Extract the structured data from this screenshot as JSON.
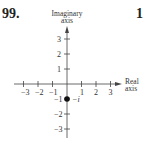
{
  "problem_number": "99.",
  "next_problem_number": "1",
  "diagram": {
    "y_axis_label_line1": "Imaginary",
    "y_axis_label_line2": "axis",
    "x_axis_label_line1": "Real",
    "x_axis_label_line2": "axis",
    "x_ticks": [
      "−3",
      "−2",
      "−1",
      "1",
      "2",
      "3"
    ],
    "y_ticks": [
      "3",
      "2",
      "1",
      "−1",
      "−2",
      "−3"
    ],
    "point_label": "−i",
    "point": {
      "x": 0,
      "y": -1
    }
  }
}
